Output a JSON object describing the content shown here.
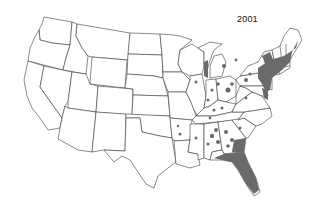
{
  "map": {
    "title": "2001",
    "region": "Contiguous United States",
    "style": "state outline map with gray shaded occurrence areas",
    "colors": {
      "background": "#ffffff",
      "outline": "#3a3a3a",
      "shaded": "#6a6a6a"
    },
    "shaded_regions": [
      "Florida (nearly entire peninsula)",
      "Gulf coast of Alabama / Georgia / Florida panhandle",
      "Atlantic coast: Georgia, South Carolina",
      "Scattered spots: Alabama, Georgia, Mississippi, Tennessee",
      "Scattered spots: Kentucky, Indiana, Ohio, Illinois",
      "Southern Michigan / Lake Michigan shore",
      "Pennsylvania, New Jersey, New York",
      "New England coast: Connecticut, Rhode Island, Massachusetts",
      "Chesapeake Bay area: Maryland, Delaware, Virginia",
      "Arkansas / Louisiana scattered spots"
    ]
  }
}
